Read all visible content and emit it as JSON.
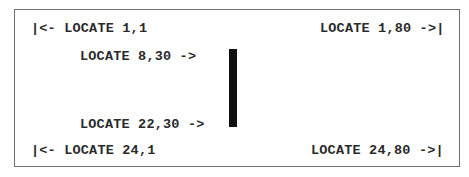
{
  "figure": {
    "labels": {
      "top_left": "|<- LOCATE 1,1",
      "top_right": "LOCATE 1,80 ->|",
      "row8_col30": "LOCATE 8,30 ->",
      "row22_col30": "LOCATE 22,30 ->",
      "bottom_left": "|<- LOCATE 24,1",
      "bottom_right": "LOCATE 24,80 ->|"
    },
    "colors": {
      "border": "#6e6e6e",
      "text": "#2a2a2a",
      "bar": "#111111",
      "background": "#ffffff"
    }
  }
}
